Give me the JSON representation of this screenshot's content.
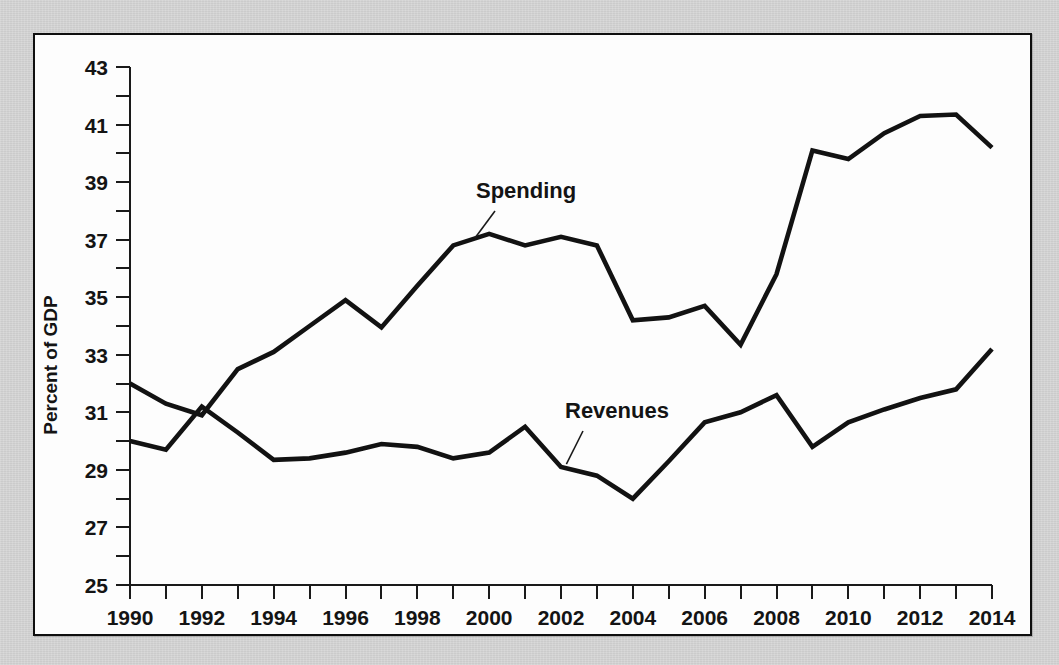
{
  "figure": {
    "background_color": "#d2d2d2",
    "plot_background_color": "#fdfdfd",
    "frame_color": "#0f0f0f",
    "line_color": "#121212"
  },
  "axes": {
    "ylabel": "Percent of GDP",
    "y_ticks": [
      "25",
      "27",
      "29",
      "31",
      "33",
      "35",
      "37",
      "39",
      "41",
      "43"
    ],
    "x_ticks": [
      "1990",
      "1992",
      "1994",
      "1996",
      "1998",
      "2000",
      "2002",
      "2004",
      "2006",
      "2008",
      "2010",
      "2012",
      "2014"
    ]
  },
  "annotations": {
    "spending_label": "Spending",
    "revenues_label": "Revenues"
  },
  "chart_data": {
    "type": "line",
    "title": "",
    "xlabel": "",
    "ylabel": "Percent of GDP",
    "xlim": [
      1990,
      2014
    ],
    "ylim": [
      25,
      43
    ],
    "y_tick_step": 2,
    "y_minor_tick_step": 1,
    "x_tick_step": 1,
    "x_label_step": 2,
    "grid": false,
    "legend": "inline-annotations",
    "x": [
      1990,
      1991,
      1992,
      1993,
      1994,
      1995,
      1996,
      1997,
      1998,
      1999,
      2000,
      2001,
      2002,
      2003,
      2004,
      2005,
      2006,
      2007,
      2008,
      2009,
      2010,
      2011,
      2012,
      2013,
      2014
    ],
    "series": [
      {
        "name": "Spending",
        "values": [
          32.0,
          31.3,
          30.9,
          32.5,
          33.1,
          34.0,
          34.9,
          33.95,
          35.4,
          36.8,
          37.2,
          36.8,
          37.1,
          36.8,
          34.2,
          34.3,
          34.7,
          33.35,
          35.8,
          40.1,
          39.8,
          40.7,
          41.3,
          41.35,
          40.2
        ]
      },
      {
        "name": "Revenues",
        "values": [
          30.0,
          29.7,
          31.2,
          30.3,
          29.35,
          29.4,
          29.6,
          29.9,
          29.8,
          29.4,
          29.6,
          30.5,
          29.1,
          28.8,
          28.0,
          29.3,
          30.65,
          31.0,
          31.6,
          29.8,
          30.65,
          31.1,
          31.5,
          31.8,
          33.2
        ]
      }
    ]
  }
}
